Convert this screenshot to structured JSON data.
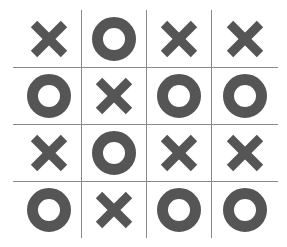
{
  "game": {
    "name": "tic-tac-toe-4x4",
    "rows": 4,
    "cols": 4,
    "symbol_color": "#555555",
    "grid_color": "#8a8a8a",
    "background": "#ffffff",
    "board": [
      [
        "X",
        "O",
        "X",
        "X"
      ],
      [
        "O",
        "X",
        "O",
        "O"
      ],
      [
        "X",
        "O",
        "X",
        "X"
      ],
      [
        "O",
        "X",
        "O",
        "O"
      ]
    ]
  }
}
